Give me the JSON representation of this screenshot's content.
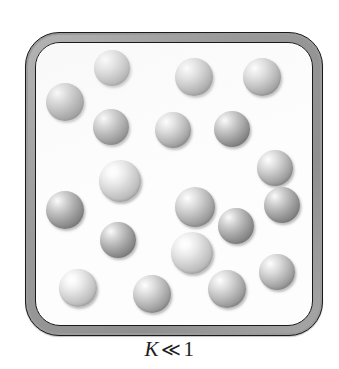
{
  "figure": {
    "name": "gas-phase-equilibrium-box",
    "background_color": "#ffffff",
    "width": 339,
    "height": 369
  },
  "vessel": {
    "name": "reaction-vessel",
    "shape": "rounded-square",
    "frame_color": "#9b9b9b",
    "frame_outline_color": "#1a1a1a",
    "interior_color": "#fdfdfd",
    "bounds": {
      "x": 25,
      "y": 32,
      "width": 298,
      "height": 304
    },
    "corner_radius": 34,
    "frame_thickness": 10
  },
  "caption": {
    "symbol": "K",
    "relation": "≪",
    "value": "1",
    "full_text": "K ≪ 1",
    "meaning": "equilibrium constant much less than one"
  },
  "particles": {
    "count": 19,
    "label": "molecule-sphere",
    "base_color": "#a8a8a8",
    "highlight_color": "#ffffff",
    "shadow_color": "#757575",
    "items": [
      {
        "id": 1,
        "x": 112,
        "y": 68,
        "r": 18,
        "tone": "normal"
      },
      {
        "id": 2,
        "x": 194,
        "y": 77,
        "r": 19,
        "tone": "normal"
      },
      {
        "id": 3,
        "x": 262,
        "y": 77,
        "r": 19,
        "tone": "normal"
      },
      {
        "id": 4,
        "x": 65,
        "y": 102,
        "r": 19,
        "tone": "dark"
      },
      {
        "id": 5,
        "x": 111,
        "y": 127,
        "r": 18,
        "tone": "dark"
      },
      {
        "id": 6,
        "x": 173,
        "y": 130,
        "r": 18,
        "tone": "normal"
      },
      {
        "id": 7,
        "x": 232,
        "y": 129,
        "r": 18,
        "tone": "dark"
      },
      {
        "id": 8,
        "x": 275,
        "y": 168,
        "r": 18,
        "tone": "normal"
      },
      {
        "id": 9,
        "x": 120,
        "y": 181,
        "r": 21,
        "tone": "light"
      },
      {
        "id": 10,
        "x": 65,
        "y": 210,
        "r": 19,
        "tone": "dark"
      },
      {
        "id": 11,
        "x": 195,
        "y": 207,
        "r": 20,
        "tone": "normal"
      },
      {
        "id": 12,
        "x": 236,
        "y": 226,
        "r": 18,
        "tone": "dark"
      },
      {
        "id": 13,
        "x": 118,
        "y": 240,
        "r": 18,
        "tone": "dark"
      },
      {
        "id": 14,
        "x": 192,
        "y": 253,
        "r": 21,
        "tone": "light"
      },
      {
        "id": 15,
        "x": 277,
        "y": 272,
        "r": 18,
        "tone": "normal"
      },
      {
        "id": 16,
        "x": 78,
        "y": 288,
        "r": 19,
        "tone": "light"
      },
      {
        "id": 17,
        "x": 152,
        "y": 294,
        "r": 19,
        "tone": "normal"
      },
      {
        "id": 18,
        "x": 227,
        "y": 289,
        "r": 19,
        "tone": "normal"
      },
      {
        "id": 19,
        "x": 282,
        "y": 205,
        "r": 18,
        "tone": "dark"
      }
    ]
  }
}
